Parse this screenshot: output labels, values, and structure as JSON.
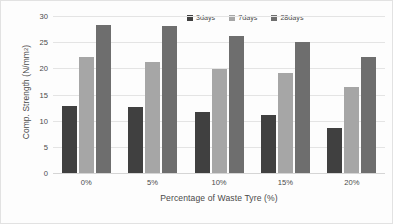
{
  "chart_data": {
    "type": "bar",
    "title": "",
    "subtitle": "",
    "xlabel": "Percentage of Waste Tyre (%)",
    "ylabel": "Comp. Strength (N/mm2)",
    "ylabel_main": "Comp. Strength (N/mm",
    "ylabel_sup": "2",
    "ylabel_tail": ")",
    "categories": [
      "0%",
      "5%",
      "10%",
      "15%",
      "20%"
    ],
    "series": [
      {
        "name": "3days",
        "color": "#404040",
        "values": [
          12.8,
          12.6,
          11.7,
          11.0,
          8.6
        ]
      },
      {
        "name": "7days",
        "color": "#a6a6a6",
        "values": [
          22.1,
          21.3,
          19.9,
          19.1,
          16.5
        ]
      },
      {
        "name": "28days",
        "color": "#6e6e6e",
        "values": [
          28.2,
          28.0,
          26.2,
          25.0,
          22.2
        ]
      }
    ],
    "ylim": [
      0,
      30
    ],
    "ytick_values": [
      0,
      5,
      10,
      15,
      20,
      25,
      30
    ],
    "ytick_labels": [
      "0",
      "5",
      "10",
      "15",
      "20",
      "25",
      "30"
    ],
    "grid": true,
    "grid_axis": "y",
    "legend_position": "top-right",
    "bar_group_layout": "clustered",
    "background_color": "#fdfdfd",
    "border_color": "#e2e2e2",
    "gridline_color": "#e4e4e4",
    "text_color": "#4a4a4a"
  }
}
